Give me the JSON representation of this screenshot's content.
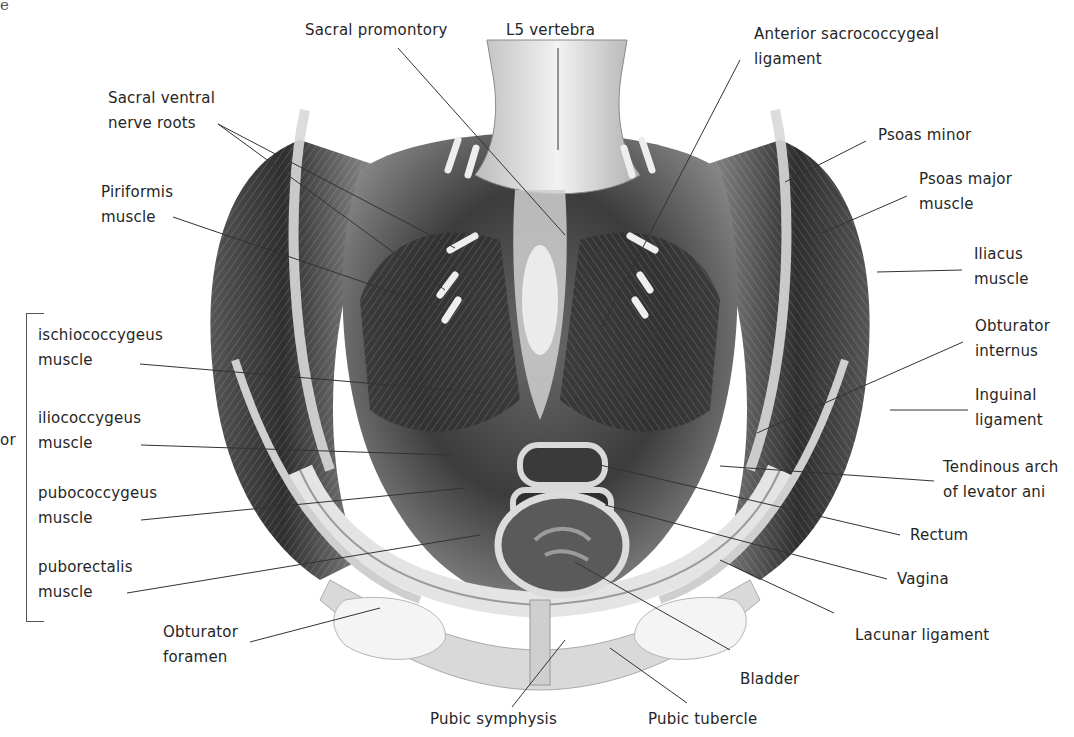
{
  "figure": {
    "clipped_text_top_left": "e",
    "clipped_text_left_group": "or",
    "labels": {
      "sacral_promontory": "Sacral promontory",
      "l5_vertebra": "L5 vertebra",
      "anterior_sacrococcygeal": [
        "Anterior sacrococcygeal",
        "ligament"
      ],
      "sacral_ventral_nerve_roots": [
        "Sacral ventral",
        "nerve roots"
      ],
      "piriformis": [
        "Piriformis",
        "muscle"
      ],
      "psoas_minor": "Psoas minor",
      "psoas_major": [
        "Psoas major",
        "muscle"
      ],
      "iliacus": [
        "Iliacus",
        "muscle"
      ],
      "obturator_internus": [
        "Obturator",
        "internus"
      ],
      "inguinal_ligament": [
        "Inguinal",
        "ligament"
      ],
      "tendinous_arch": [
        "Tendinous arch",
        "of levator ani"
      ],
      "rectum": "Rectum",
      "vagina": "Vagina",
      "lacunar_ligament": "Lacunar ligament",
      "bladder": "Bladder",
      "pubic_tubercle": "Pubic tubercle",
      "pubic_symphysis": "Pubic symphysis",
      "obturator_foramen": [
        "Obturator",
        "foramen"
      ]
    },
    "levator_ani_group": [
      [
        "ischiococcygeus",
        "muscle"
      ],
      [
        "iliococcygeus",
        "muscle"
      ],
      [
        "pubococcygeus",
        "muscle"
      ],
      [
        "puborectalis",
        "muscle"
      ]
    ],
    "colors": {
      "label_text": "#262626",
      "leader_line": "#333333",
      "muscle_dark": "#3a3a3a",
      "muscle_mid": "#7a7a7a",
      "bone_light": "#e6e6e6",
      "background": "#ffffff"
    }
  }
}
